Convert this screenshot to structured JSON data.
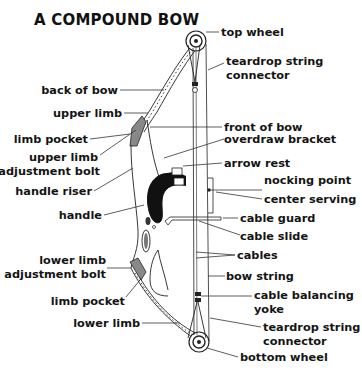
{
  "title": "A COMPOUND BOW",
  "labels": {
    "top_wheel": "top wheel",
    "teardrop_top_1": "teardrop string",
    "teardrop_top_2": "connector",
    "back_of_bow": "back of bow",
    "upper_limb": "upper limb",
    "front_of_bow": "front of bow",
    "limb_pocket_upper": "limb pocket",
    "upper_bolt_1": "upper limb",
    "upper_bolt_2": "adjustment bolt",
    "overdraw_bracket": "overdraw bracket",
    "arrow_rest": "arrow rest",
    "handle_riser": "handle riser",
    "nocking_point": "nocking point",
    "center_serving": "center serving",
    "handle": "handle",
    "cable_guard": "cable guard",
    "cable_slide": "cable slide",
    "cables": "cables",
    "lower_bolt_1": "lower limb",
    "lower_bolt_2": "adjustment bolt",
    "bow_string": "bow string",
    "limb_pocket_lower": "limb pocket",
    "yoke_1": "cable balancing",
    "yoke_2": "yoke",
    "teardrop_bottom_1": "teardrop string",
    "teardrop_bottom_2": "connector",
    "lower_limb": "lower limb",
    "bottom_wheel": "bottom wheel"
  }
}
